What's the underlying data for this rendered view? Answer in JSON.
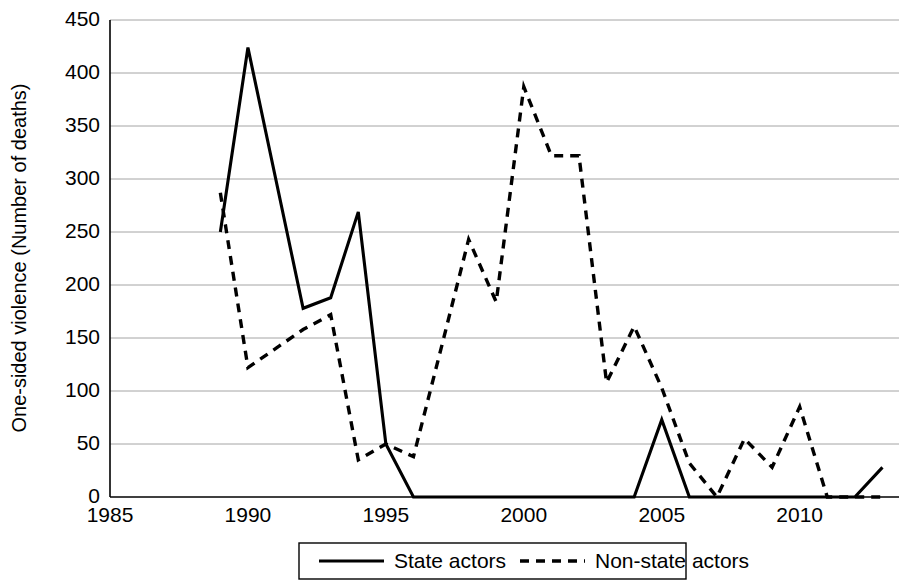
{
  "chart_data": {
    "type": "line",
    "title": "",
    "xlabel": "",
    "ylabel": "One-sided violence (Number of deaths)",
    "xlim": [
      1985,
      2013.6
    ],
    "ylim": [
      0,
      450
    ],
    "ytick_step": 50,
    "yticks": [
      0,
      50,
      100,
      150,
      200,
      250,
      300,
      350,
      400,
      450
    ],
    "xticks": [
      1985,
      1990,
      1995,
      2000,
      2005,
      2010
    ],
    "xtick_labels": [
      "1985",
      "1990",
      "1995",
      "2000",
      "2005",
      "2010"
    ],
    "ytick_labels": [
      "0",
      "50",
      "100",
      "150",
      "200",
      "250",
      "300",
      "350",
      "400",
      "450"
    ],
    "grid": "horizontal",
    "legend_position": "bottom-center",
    "series": [
      {
        "name": "State actors",
        "style": "solid",
        "color": "#000000",
        "x": [
          1989,
          1990,
          1992,
          1993,
          1994,
          1995,
          1996,
          1997,
          1998,
          1999,
          2000,
          2001,
          2002,
          2003,
          2004,
          2005,
          2006,
          2007,
          2008,
          2009,
          2010,
          2011,
          2012,
          2013
        ],
        "values": [
          250,
          424,
          178,
          188,
          269,
          50,
          0,
          0,
          0,
          0,
          0,
          0,
          0,
          0,
          0,
          73,
          0,
          0,
          0,
          0,
          0,
          0,
          0,
          28
        ]
      },
      {
        "name": "Non-state actors",
        "style": "dashed",
        "color": "#000000",
        "x": [
          1989,
          1990,
          1991,
          1992,
          1993,
          1994,
          1995,
          1996,
          1997,
          1998,
          1999,
          2000,
          2001,
          2002,
          2003,
          2004,
          2005,
          2006,
          2007,
          2008,
          2009,
          2010,
          2011,
          2012,
          2013
        ],
        "values": [
          287,
          122,
          140,
          158,
          172,
          35,
          50,
          38,
          140,
          243,
          184,
          387,
          322,
          322,
          108,
          161,
          103,
          32,
          0,
          55,
          28,
          85,
          0,
          0,
          0
        ]
      }
    ],
    "legend": [
      {
        "label": "State actors",
        "style": "solid"
      },
      {
        "label": "Non-state actors",
        "style": "dashed"
      }
    ]
  }
}
